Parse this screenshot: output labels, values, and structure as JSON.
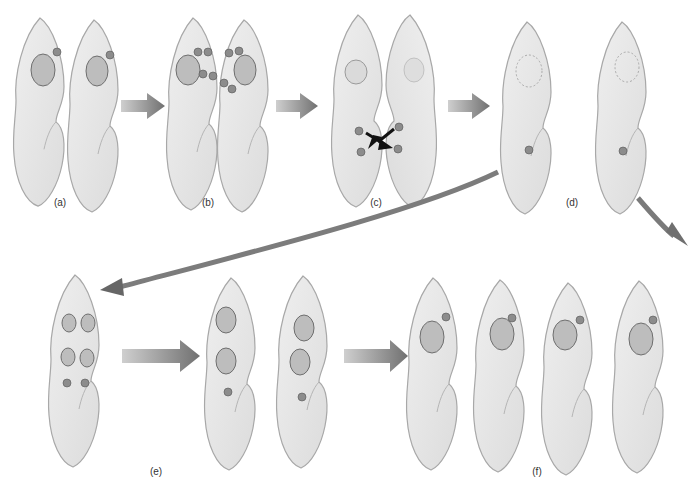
{
  "diagram": {
    "stages": [
      {
        "id": "a",
        "label": "(a)",
        "label_x": 60,
        "label_y": 203
      },
      {
        "id": "b",
        "label": "(b)",
        "label_x": 208,
        "label_y": 203
      },
      {
        "id": "c",
        "label": "(c)",
        "label_x": 376,
        "label_y": 203
      },
      {
        "id": "d",
        "label": "(d)",
        "label_x": 572,
        "label_y": 203
      },
      {
        "id": "e",
        "label": "(e)",
        "label_x": 156,
        "label_y": 472
      },
      {
        "id": "f",
        "label": "(f)",
        "label_x": 537,
        "label_y": 472
      }
    ],
    "colors": {
      "cell_fill": "#e8e8e8",
      "cell_stroke": "#a8a8a8",
      "macronucleus": "#bdbdbd",
      "micronucleus": "#8c8c8c",
      "arrow": "#7a7a7a",
      "exchange_arrow": "#111111"
    }
  }
}
